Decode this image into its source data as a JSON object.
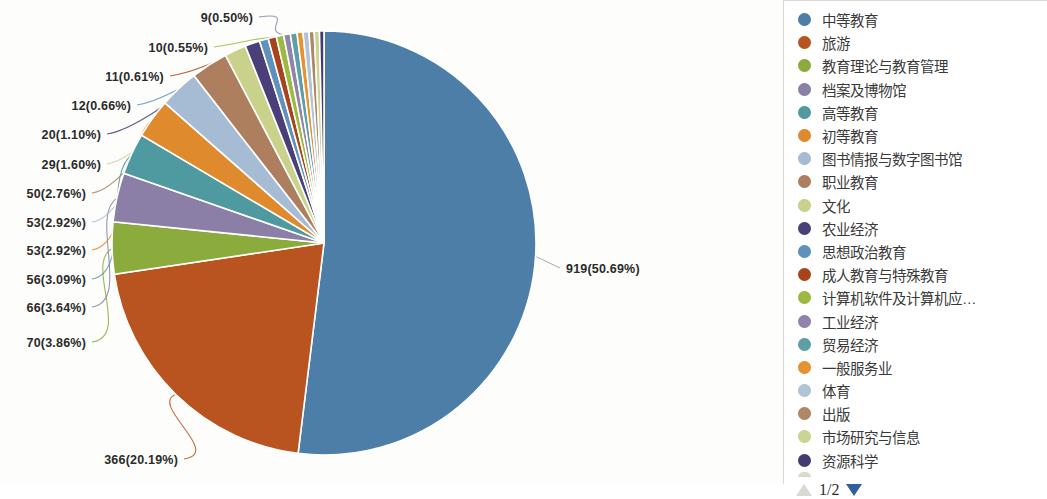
{
  "chart_data": {
    "type": "pie",
    "title": "",
    "legend_position": "right",
    "total": 1813,
    "value_format": "count(percent)",
    "categories": [
      "中等教育",
      "旅游",
      "教育理论与教育管理",
      "档案及博物馆",
      "高等教育",
      "初等教育",
      "图书情报与数字图书馆",
      "职业教育",
      "文化",
      "农业经济",
      "思想政治教育",
      "成人教育与特殊教育",
      "计算机软件及计算机应…",
      "工业经济",
      "贸易经济",
      "一般服务业",
      "体育",
      "出版",
      "市场研究与信息",
      "资源科学"
    ],
    "values": [
      919,
      366,
      70,
      66,
      56,
      53,
      53,
      50,
      29,
      20,
      12,
      11,
      10,
      9,
      9,
      8,
      8,
      7,
      7,
      6
    ],
    "percents": [
      50.69,
      20.19,
      3.86,
      3.64,
      3.09,
      2.92,
      2.92,
      2.76,
      1.6,
      1.1,
      0.66,
      0.61,
      0.55,
      0.5,
      0.5,
      0.44,
      0.44,
      0.39,
      0.39,
      0.33
    ],
    "colors": [
      "#4d7ea8",
      "#b9531f",
      "#8bab3c",
      "#8b7fa8",
      "#4e9aa0",
      "#e08a2e",
      "#a6bcd4",
      "#ae7f5e",
      "#c9d18a",
      "#4b3f7a",
      "#5e92bd",
      "#a8431c",
      "#9cbb3e",
      "#9083ad",
      "#5ba0a4",
      "#e99030",
      "#b0c4d8",
      "#b08764",
      "#ccd492",
      "#443a72"
    ],
    "callout_labels": [
      {
        "text": "9(0.50%)",
        "value": 9,
        "percent": 0.5
      },
      {
        "text": "10(0.55%)",
        "value": 10,
        "percent": 0.55
      },
      {
        "text": "11(0.61%)",
        "value": 11,
        "percent": 0.61
      },
      {
        "text": "12(0.66%)",
        "value": 12,
        "percent": 0.66
      },
      {
        "text": "20(1.10%)",
        "value": 20,
        "percent": 1.1
      },
      {
        "text": "29(1.60%)",
        "value": 29,
        "percent": 1.6
      },
      {
        "text": "50(2.76%)",
        "value": 50,
        "percent": 2.76
      },
      {
        "text": "53(2.92%)",
        "value": 53,
        "percent": 2.92
      },
      {
        "text": "53(2.92%)",
        "value": 53,
        "percent": 2.92
      },
      {
        "text": "56(3.09%)",
        "value": 56,
        "percent": 3.09
      },
      {
        "text": "66(3.64%)",
        "value": 66,
        "percent": 3.64
      },
      {
        "text": "70(3.86%)",
        "value": 70,
        "percent": 3.86
      },
      {
        "text": "366(20.19%)",
        "value": 366,
        "percent": 20.19
      },
      {
        "text": "919(50.69%)",
        "value": 919,
        "percent": 50.69
      }
    ]
  },
  "labels": {
    "l0": "9(0.50%)",
    "l1": "10(0.55%)",
    "l2": "11(0.61%)",
    "l3": "12(0.66%)",
    "l4": "20(1.10%)",
    "l5": "29(1.60%)",
    "l6": "50(2.76%)",
    "l7": "53(2.92%)",
    "l8": "53(2.92%)",
    "l9": "56(3.09%)",
    "l10": "66(3.64%)",
    "l11": "70(3.86%)",
    "l12": "366(20.19%)",
    "l13": "919(50.69%)"
  },
  "legend": {
    "items": [
      {
        "label": "中等教育",
        "color": "#4d7ea8"
      },
      {
        "label": "旅游",
        "color": "#b9531f"
      },
      {
        "label": "教育理论与教育管理",
        "color": "#8bab3c"
      },
      {
        "label": "档案及博物馆",
        "color": "#8b7fa8"
      },
      {
        "label": "高等教育",
        "color": "#4e9aa0"
      },
      {
        "label": "初等教育",
        "color": "#e08a2e"
      },
      {
        "label": "图书情报与数字图书馆",
        "color": "#a6bcd4"
      },
      {
        "label": "职业教育",
        "color": "#ae7f5e"
      },
      {
        "label": "文化",
        "color": "#c9d18a"
      },
      {
        "label": "农业经济",
        "color": "#4b3f7a"
      },
      {
        "label": "思想政治教育",
        "color": "#5e92bd"
      },
      {
        "label": "成人教育与特殊教育",
        "color": "#a8431c"
      },
      {
        "label": "计算机软件及计算机应…",
        "color": "#9cbb3e"
      },
      {
        "label": "工业经济",
        "color": "#9083ad"
      },
      {
        "label": "贸易经济",
        "color": "#5ba0a4"
      },
      {
        "label": "一般服务业",
        "color": "#e99030"
      },
      {
        "label": "体育",
        "color": "#b0c4d8"
      },
      {
        "label": "出版",
        "color": "#b08764"
      },
      {
        "label": "市场研究与信息",
        "color": "#ccd492"
      },
      {
        "label": "资源科学",
        "color": "#443a72"
      }
    ],
    "pager": {
      "text": "1/2",
      "up_icon": "triangle-up-icon",
      "down_icon": "triangle-down-icon"
    }
  }
}
